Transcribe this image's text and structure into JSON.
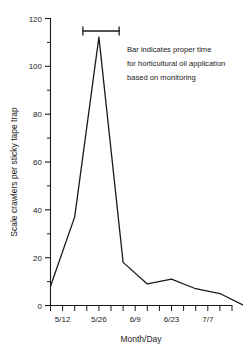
{
  "chart_data": {
    "type": "line",
    "title": "",
    "xlabel": "Month/Day",
    "ylabel": "Scale crawlers per sticky tape trap",
    "ylim": [
      0,
      120
    ],
    "ytick_values": [
      0,
      20,
      40,
      60,
      80,
      100,
      120
    ],
    "ytick_labels": [
      "0",
      "20",
      "40",
      "60",
      "80",
      "100",
      "120"
    ],
    "yminor_step": 10,
    "xtick_labels": [
      "5/12",
      "5/26",
      "6/9",
      "6/23",
      "7/7"
    ],
    "xtick_dates": [
      "5/12",
      "5/19",
      "5/26",
      "6/2",
      "6/9",
      "6/16",
      "6/23",
      "6/30",
      "7/7",
      "7/14"
    ],
    "grid": false,
    "legend": "none",
    "series": [
      {
        "name": "Scale crawlers per sticky tape trap",
        "color": "#1a1a1a",
        "x": [
          "5/12",
          "5/19",
          "5/26",
          "6/2",
          "6/9",
          "6/16",
          "6/23",
          "6/30",
          "7/7",
          "7/14"
        ],
        "values": [
          8,
          37,
          112,
          18,
          9,
          11,
          7,
          5,
          0,
          1
        ]
      }
    ],
    "annotations": [
      {
        "name": "treatment-window-bar",
        "kind": "range-bar",
        "start": "5/21",
        "end": "6/2",
        "y": 115,
        "color": "#1a1a1a"
      },
      {
        "name": "annotation-text",
        "kind": "text",
        "lines": [
          "Bar indicates proper time",
          "for horticultural oil application",
          "based on monitoring"
        ]
      }
    ]
  },
  "axes": {
    "y_axis_label": "Scale crawlers per sticky tape trap",
    "x_axis_label": "Month/Day"
  },
  "annotation": {
    "line1": "Bar indicates proper time",
    "line2": "for horticultural oil application",
    "line3": "based on monitoring"
  },
  "yticks": [
    {
      "label": "120",
      "value": 120
    },
    {
      "label": "100",
      "value": 100
    },
    {
      "label": "80",
      "value": 80
    },
    {
      "label": "60",
      "value": 60
    },
    {
      "label": "40",
      "value": 40
    },
    {
      "label": "20",
      "value": 20
    },
    {
      "label": "0",
      "value": 0
    }
  ],
  "xticks": [
    {
      "label": "5/12",
      "value": 0
    },
    {
      "label": "5/26",
      "value": 2
    },
    {
      "label": "6/9",
      "value": 4
    },
    {
      "label": "6/23",
      "value": 6
    },
    {
      "label": "7/7",
      "value": 8
    }
  ],
  "colors": {
    "line": "#1a1a1a",
    "axis": "#1a1a1a",
    "text": "#1a1a1a",
    "background": "#ffffff"
  }
}
